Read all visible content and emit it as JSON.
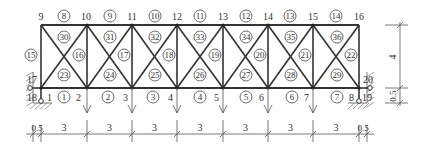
{
  "diagram": {
    "type": "truss",
    "colors": {
      "line": "#333333",
      "background": "#ffffff"
    },
    "top_nodes": [
      {
        "id": "9",
        "x": 41,
        "y": 25
      },
      {
        "id": "10",
        "x": 87,
        "y": 25
      },
      {
        "id": "11",
        "x": 132,
        "y": 25
      },
      {
        "id": "12",
        "x": 177,
        "y": 25
      },
      {
        "id": "13",
        "x": 223,
        "y": 25
      },
      {
        "id": "14",
        "x": 268,
        "y": 25
      },
      {
        "id": "15",
        "x": 313,
        "y": 25
      },
      {
        "id": "16",
        "x": 359,
        "y": 25
      }
    ],
    "bottom_nodes": [
      {
        "id": "1",
        "x": 41,
        "y": 88
      },
      {
        "id": "2",
        "x": 87,
        "y": 88
      },
      {
        "id": "3",
        "x": 132,
        "y": 88
      },
      {
        "id": "4",
        "x": 177,
        "y": 88
      },
      {
        "id": "5",
        "x": 223,
        "y": 88
      },
      {
        "id": "6",
        "x": 268,
        "y": 88
      },
      {
        "id": "7",
        "x": 313,
        "y": 88
      },
      {
        "id": "8",
        "x": 359,
        "y": 88
      }
    ],
    "support_nodes": [
      {
        "id": "17",
        "desc": "left horizontal link"
      },
      {
        "id": "18",
        "desc": "left vertical link"
      },
      {
        "id": "19",
        "desc": "right vertical link"
      },
      {
        "id": "20",
        "desc": "right horizontal link"
      }
    ],
    "bottom_chord_members": [
      "1",
      "2",
      "3",
      "4",
      "5",
      "6",
      "7"
    ],
    "top_chord_members": [
      "8",
      "9",
      "10",
      "11",
      "12",
      "13",
      "14"
    ],
    "vertical_members": [
      "15",
      "16",
      "17",
      "18",
      "19",
      "20",
      "21",
      "22"
    ],
    "lower_diagonal_labels": [
      "23",
      "24",
      "25",
      "26",
      "27",
      "28",
      "29"
    ],
    "upper_diagonal_labels": [
      "30",
      "31",
      "32",
      "33",
      "34",
      "35",
      "36"
    ],
    "loads": {
      "direction": "down",
      "at_nodes": [
        "2",
        "3",
        "4",
        "5",
        "6",
        "7"
      ]
    },
    "dimensions": {
      "horizontal": [
        "0.5",
        "3",
        "3",
        "3",
        "3",
        "3",
        "3",
        "3",
        "0.5"
      ],
      "vertical": [
        "4",
        "0.5"
      ]
    }
  }
}
